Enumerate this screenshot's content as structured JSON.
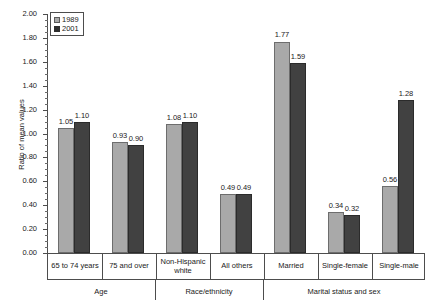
{
  "chart_data": {
    "type": "bar",
    "title": "",
    "xlabel": "",
    "ylabel": "Ratio of mean values",
    "ylim": [
      0.0,
      2.0
    ],
    "ytick_step": 0.2,
    "minor_ticks": true,
    "grid": false,
    "legend_position": "top-left",
    "categories": [
      "65 to 74 years",
      "75 and over",
      "Non-Hispanic white",
      "All others",
      "Married",
      "Single-female",
      "Single-male"
    ],
    "groups": [
      {
        "label": "Age",
        "categories": [
          "65 to 74 years",
          "75 and over"
        ]
      },
      {
        "label": "Race/ethnicity",
        "categories": [
          "Non-Hispanic white",
          "All others"
        ]
      },
      {
        "label": "Marital status and sex",
        "categories": [
          "Married",
          "Single-female",
          "Single-male"
        ]
      }
    ],
    "series": [
      {
        "name": "1989",
        "color": "#a9a9a9",
        "values": [
          1.05,
          0.93,
          1.08,
          0.49,
          1.77,
          0.34,
          0.56
        ],
        "labels": [
          "1.05",
          "0.93",
          "1.08",
          "0.49",
          "1.77",
          "0.34",
          "0.56"
        ]
      },
      {
        "name": "2001",
        "color": "#414141",
        "values": [
          1.1,
          0.9,
          1.1,
          0.49,
          1.59,
          0.32,
          1.28
        ],
        "labels": [
          "1.10",
          "0.90",
          "1.10",
          "0.49",
          "1.59",
          "0.32",
          "1.28"
        ]
      }
    ],
    "ytick_labels": [
      "0.00",
      "0.20",
      "0.40",
      "0.60",
      "0.80",
      "1.00",
      "1.20",
      "1.40",
      "1.60",
      "1.80",
      "2.00"
    ]
  },
  "legend": {
    "entries": [
      {
        "label": "1989"
      },
      {
        "label": "2001"
      }
    ]
  }
}
